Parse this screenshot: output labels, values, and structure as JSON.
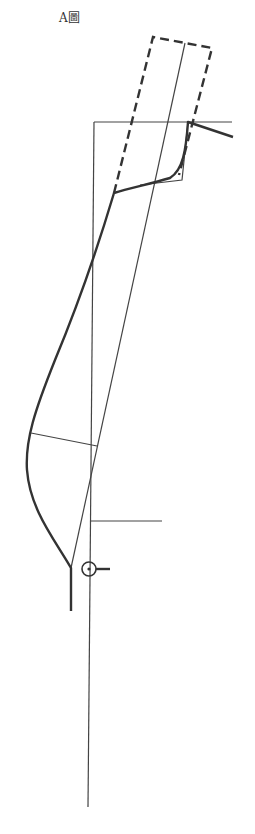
{
  "figure": {
    "label": "A圖"
  },
  "colors": {
    "line": "#333333",
    "background": "#ffffff"
  },
  "elements": [
    {
      "name": "reference-vertical-line",
      "style": "thin"
    },
    {
      "name": "reference-horizontal-line-top",
      "style": "thin"
    },
    {
      "name": "reference-horizontal-line-knee",
      "style": "thin"
    },
    {
      "name": "diagonal-grain-line",
      "style": "thin"
    },
    {
      "name": "dashed-extension-rectangle",
      "style": "dashed-thick"
    },
    {
      "name": "outline-curve",
      "style": "thick"
    },
    {
      "name": "crossing-line",
      "style": "thin"
    },
    {
      "name": "pivot-circle-marker",
      "style": "thin"
    }
  ]
}
